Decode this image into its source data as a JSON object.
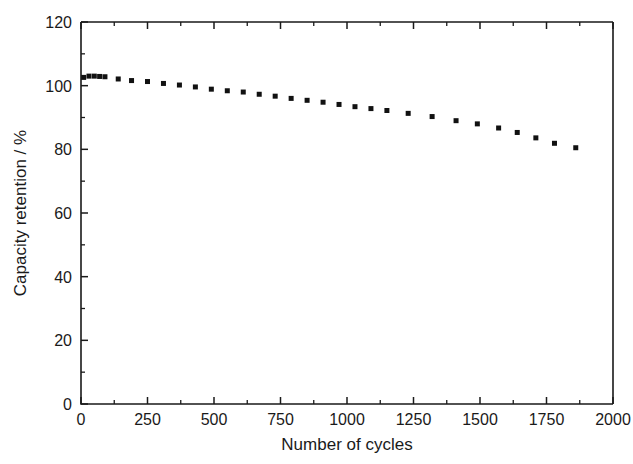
{
  "chart_data": {
    "type": "scatter",
    "title": "",
    "xlabel": "Number of cycles",
    "ylabel": "Capacity retention / %",
    "xlim": [
      0,
      2000
    ],
    "ylim": [
      0,
      120
    ],
    "xticks": [
      0,
      250,
      500,
      750,
      1000,
      1250,
      1500,
      1750,
      2000
    ],
    "xtick_labels": [
      "0",
      "250",
      "500",
      "750",
      "1000",
      "1250",
      "1500",
      "1750",
      "2000"
    ],
    "x_minor_interval": 125,
    "yticks": [
      0,
      20,
      40,
      60,
      80,
      100,
      120
    ],
    "ytick_labels": [
      "0",
      "20",
      "40",
      "60",
      "80",
      "100",
      "120"
    ],
    "y_minor_interval": 10,
    "grid": false,
    "legend": null,
    "marker": "square",
    "marker_color": "#111111",
    "marker_size": 5,
    "series": [
      {
        "name": "Capacity retention",
        "x": [
          10,
          30,
          50,
          70,
          90,
          140,
          190,
          250,
          310,
          370,
          430,
          490,
          550,
          610,
          670,
          730,
          790,
          850,
          910,
          970,
          1030,
          1090,
          1150,
          1230,
          1320,
          1410,
          1490,
          1570,
          1640,
          1710,
          1780,
          1860
        ],
        "y": [
          102.6,
          103.0,
          103.0,
          102.9,
          102.8,
          102.1,
          101.6,
          101.3,
          100.7,
          100.2,
          99.6,
          98.9,
          98.4,
          98.0,
          97.3,
          96.7,
          96.0,
          95.4,
          94.8,
          94.1,
          93.4,
          92.8,
          92.2,
          91.3,
          90.3,
          89.0,
          88.0,
          86.7,
          85.3,
          83.6,
          81.9,
          80.5
        ]
      }
    ]
  },
  "axis_titles": {
    "x": "Number of cycles",
    "y": "Capacity retention / %"
  }
}
